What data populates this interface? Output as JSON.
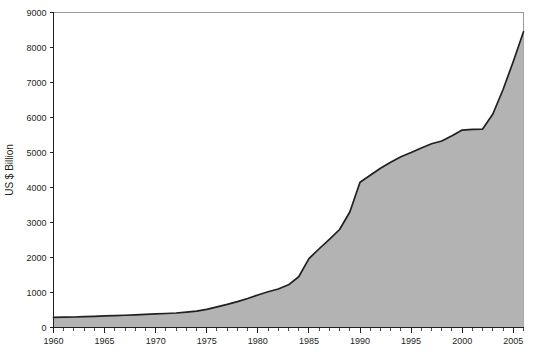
{
  "chart_data": {
    "type": "area",
    "title": "",
    "subtitle": "",
    "xlabel": "",
    "ylabel": "US $ Billion",
    "xlim": [
      1960,
      2006
    ],
    "ylim": [
      0,
      9000
    ],
    "grid": false,
    "legend": false,
    "legend_position": "none",
    "x_tick_labels": [
      "1960",
      "1965",
      "1970",
      "1975",
      "1980",
      "1985",
      "1990",
      "1995",
      "2000",
      "2005"
    ],
    "x_ticks": [
      1960,
      1965,
      1970,
      1975,
      1980,
      1985,
      1990,
      1995,
      2000,
      2005
    ],
    "x_minor_tick_interval": 1,
    "y_tick_labels": [
      "0",
      "1000",
      "2000",
      "3000",
      "4000",
      "5000",
      "6000",
      "7000",
      "8000",
      "9000"
    ],
    "y_ticks": [
      0,
      1000,
      2000,
      3000,
      4000,
      5000,
      6000,
      7000,
      8000,
      9000
    ],
    "series": [
      {
        "name": "US $ Billion",
        "fill_color": "#b3b3b3",
        "line_color": "#231f20",
        "x": [
          1960,
          1961,
          1962,
          1963,
          1964,
          1965,
          1966,
          1967,
          1968,
          1969,
          1970,
          1971,
          1972,
          1973,
          1974,
          1975,
          1976,
          1977,
          1978,
          1979,
          1980,
          1981,
          1982,
          1983,
          1984,
          1985,
          1986,
          1987,
          1988,
          1989,
          1990,
          1991,
          1992,
          1993,
          1994,
          1995,
          1996,
          1997,
          1998,
          1999,
          2000,
          2001,
          2002,
          2003,
          2004,
          2005,
          2006
        ],
        "values": [
          290,
          295,
          300,
          310,
          320,
          330,
          340,
          350,
          360,
          375,
          390,
          400,
          415,
          440,
          470,
          520,
          590,
          660,
          740,
          830,
          930,
          1020,
          1100,
          1220,
          1450,
          1970,
          2250,
          2520,
          2800,
          3300,
          4150,
          4350,
          4550,
          4720,
          4880,
          5000,
          5130,
          5250,
          5330,
          5480,
          5640,
          5660,
          5670,
          6100,
          6800,
          7600,
          8450
        ]
      }
    ],
    "annotations": []
  },
  "colors": {
    "background": "#ffffff",
    "axis": "#231f20",
    "frame": "#9a9a9a",
    "area_fill": "#b3b3b3",
    "area_line": "#231f20",
    "text": "#231f20"
  }
}
